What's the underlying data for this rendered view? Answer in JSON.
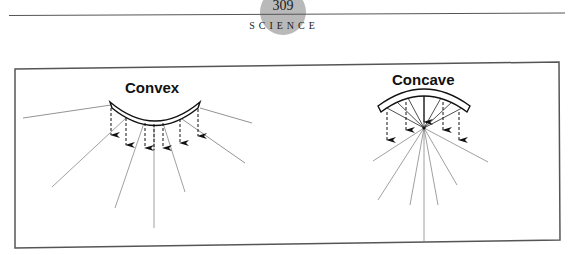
{
  "header": {
    "page_number": "309",
    "section": "SCIENCE",
    "circle_color": "#b9b9b9"
  },
  "figure": {
    "convex": {
      "label": "Convex",
      "lens_shape": "curved band bulging downward",
      "rays": "diverging solid rays",
      "arrows": "dashed downward arrows"
    },
    "concave": {
      "label": "Concave",
      "lens_shape": "curved band bulging upward",
      "rays": "converging solid rays to focal point then diverging",
      "arrows": "dashed downward arrows"
    },
    "border_color": "#555555",
    "line_color": "#333333"
  }
}
